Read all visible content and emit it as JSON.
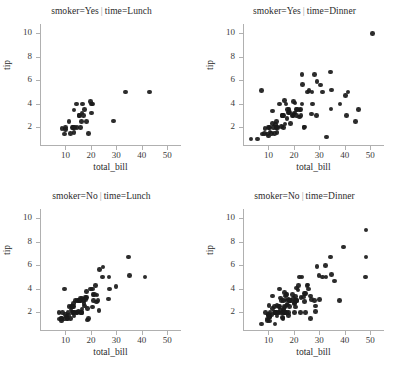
{
  "chart_data": {
    "type": "scatter",
    "title": "",
    "xlabel": "total_bill",
    "ylabel": "tip",
    "xlim": [
      0,
      55
    ],
    "ylim": [
      0.5,
      10.8
    ],
    "xticks": [
      10,
      20,
      30,
      40,
      50
    ],
    "yticks": [
      2,
      4,
      6,
      8,
      10
    ],
    "grid": false,
    "legend": "none",
    "marker_color": "#1a1a1a",
    "facet_separator": "|",
    "facets": [
      {
        "id": "smoker-yes-lunch",
        "title_left": "smoker=Yes",
        "title_right": "time=Lunch",
        "row": 0,
        "col": 0,
        "points": [
          [
            8.58,
            1.92
          ],
          [
            9.55,
            1.45
          ],
          [
            10.07,
            1.83
          ],
          [
            10.09,
            2.0
          ],
          [
            11.35,
            2.5
          ],
          [
            12.03,
            1.5
          ],
          [
            12.74,
            2.01
          ],
          [
            13.0,
            2.0
          ],
          [
            13.13,
            2.0
          ],
          [
            13.42,
            1.58
          ],
          [
            13.42,
            3.48
          ],
          [
            13.81,
            2.0
          ],
          [
            14.31,
            4.0
          ],
          [
            14.52,
            2.0
          ],
          [
            15.38,
            3.0
          ],
          [
            15.53,
            3.0
          ],
          [
            16.0,
            2.0
          ],
          [
            16.27,
            2.5
          ],
          [
            16.47,
            3.23
          ],
          [
            16.58,
            4.0
          ],
          [
            17.07,
            3.0
          ],
          [
            17.47,
            3.5
          ],
          [
            18.35,
            2.5
          ],
          [
            19.08,
            1.5
          ],
          [
            19.81,
            4.19
          ],
          [
            20.23,
            4.0
          ],
          [
            20.29,
            3.21
          ],
          [
            20.53,
            4.0
          ],
          [
            28.97,
            2.56
          ],
          [
            33.48,
            5.0
          ],
          [
            43.11,
            5.0
          ]
        ]
      },
      {
        "id": "smoker-yes-dinner",
        "title_left": "smoker=Yes",
        "title_right": "time=Dinner",
        "row": 0,
        "col": 1,
        "points": [
          [
            3.07,
            1.0
          ],
          [
            5.75,
            1.0
          ],
          [
            7.25,
            5.15
          ],
          [
            7.74,
            1.44
          ],
          [
            8.35,
            1.5
          ],
          [
            8.58,
            1.92
          ],
          [
            9.55,
            1.45
          ],
          [
            10.07,
            1.25
          ],
          [
            10.09,
            2.0
          ],
          [
            10.33,
            2.0
          ],
          [
            10.59,
            1.61
          ],
          [
            11.17,
            1.5
          ],
          [
            11.61,
            3.39
          ],
          [
            11.69,
            2.31
          ],
          [
            12.02,
            1.97
          ],
          [
            12.46,
            1.5
          ],
          [
            12.76,
            2.23
          ],
          [
            13.0,
            2.0
          ],
          [
            13.13,
            2.0
          ],
          [
            13.27,
            2.5
          ],
          [
            13.42,
            1.58
          ],
          [
            13.81,
            2.0
          ],
          [
            14.31,
            4.0
          ],
          [
            15.01,
            2.09
          ],
          [
            15.38,
            3.0
          ],
          [
            15.53,
            3.0
          ],
          [
            15.69,
            3.0
          ],
          [
            15.98,
            3.0
          ],
          [
            16.0,
            2.0
          ],
          [
            16.32,
            4.3
          ],
          [
            16.43,
            2.3
          ],
          [
            16.82,
            4.0
          ],
          [
            17.26,
            2.74
          ],
          [
            17.47,
            3.5
          ],
          [
            17.78,
            3.27
          ],
          [
            18.15,
            3.5
          ],
          [
            18.26,
            3.25
          ],
          [
            18.69,
            2.31
          ],
          [
            19.44,
            3.0
          ],
          [
            19.65,
            3.0
          ],
          [
            19.81,
            4.19
          ],
          [
            20.08,
            3.15
          ],
          [
            20.29,
            3.21
          ],
          [
            20.49,
            4.06
          ],
          [
            20.9,
            3.5
          ],
          [
            21.01,
            3.0
          ],
          [
            21.5,
            3.5
          ],
          [
            22.12,
            2.88
          ],
          [
            22.42,
            3.48
          ],
          [
            22.49,
            3.5
          ],
          [
            22.76,
            3.0
          ],
          [
            23.1,
            4.0
          ],
          [
            23.17,
            6.5
          ],
          [
            23.33,
            5.65
          ],
          [
            24.01,
            2.0
          ],
          [
            24.27,
            2.03
          ],
          [
            25.28,
            5.0
          ],
          [
            25.89,
            5.16
          ],
          [
            26.86,
            3.14
          ],
          [
            27.05,
            5.0
          ],
          [
            27.28,
            4.0
          ],
          [
            28.17,
            6.5
          ],
          [
            28.97,
            3.0
          ],
          [
            29.03,
            5.92
          ],
          [
            30.4,
            5.6
          ],
          [
            31.27,
            5.0
          ],
          [
            32.83,
            1.17
          ],
          [
            34.3,
            6.7
          ],
          [
            34.63,
            3.55
          ],
          [
            34.83,
            5.17
          ],
          [
            38.07,
            4.0
          ],
          [
            40.17,
            4.73
          ],
          [
            40.55,
            3.0
          ],
          [
            41.19,
            5.0
          ],
          [
            44.3,
            2.5
          ],
          [
            45.35,
            3.5
          ],
          [
            50.81,
            10.0
          ]
        ]
      },
      {
        "id": "smoker-no-lunch",
        "title_left": "smoker=No",
        "title_right": "time=Lunch",
        "row": 1,
        "col": 0,
        "points": [
          [
            7.51,
            2.0
          ],
          [
            7.56,
            1.44
          ],
          [
            8.35,
            1.5
          ],
          [
            8.51,
            1.25
          ],
          [
            8.52,
            1.48
          ],
          [
            8.77,
            2.0
          ],
          [
            9.55,
            1.45
          ],
          [
            9.6,
            4.0
          ],
          [
            10.07,
            1.83
          ],
          [
            10.33,
            1.67
          ],
          [
            10.65,
            1.5
          ],
          [
            10.77,
            1.47
          ],
          [
            11.02,
            1.98
          ],
          [
            11.24,
            1.76
          ],
          [
            11.35,
            2.5
          ],
          [
            12.03,
            1.5
          ],
          [
            12.16,
            2.2
          ],
          [
            12.48,
            2.52
          ],
          [
            12.54,
            2.5
          ],
          [
            12.66,
            2.5
          ],
          [
            12.69,
            2.0
          ],
          [
            13.0,
            2.0
          ],
          [
            13.16,
            2.75
          ],
          [
            13.27,
            2.5
          ],
          [
            13.37,
            2.0
          ],
          [
            13.42,
            1.68
          ],
          [
            13.81,
            2.0
          ],
          [
            14.0,
            3.0
          ],
          [
            14.48,
            2.0
          ],
          [
            14.52,
            2.0
          ],
          [
            14.83,
            3.02
          ],
          [
            15.01,
            2.09
          ],
          [
            15.38,
            3.0
          ],
          [
            15.53,
            3.0
          ],
          [
            15.81,
            3.16
          ],
          [
            15.98,
            3.0
          ],
          [
            16.0,
            2.0
          ],
          [
            16.21,
            2.0
          ],
          [
            16.43,
            2.3
          ],
          [
            16.47,
            3.23
          ],
          [
            16.49,
            2.0
          ],
          [
            17.07,
            3.0
          ],
          [
            17.26,
            2.74
          ],
          [
            17.46,
            2.54
          ],
          [
            17.78,
            3.27
          ],
          [
            17.92,
            3.08
          ],
          [
            18.24,
            3.76
          ],
          [
            18.26,
            3.25
          ],
          [
            18.64,
            1.36
          ],
          [
            18.69,
            2.31
          ],
          [
            19.08,
            1.5
          ],
          [
            19.81,
            4.0
          ],
          [
            20.53,
            4.0
          ],
          [
            20.69,
            2.45
          ],
          [
            20.9,
            3.5
          ],
          [
            21.01,
            3.0
          ],
          [
            21.5,
            3.5
          ],
          [
            21.7,
            4.3
          ],
          [
            22.12,
            2.88
          ],
          [
            22.42,
            3.48
          ],
          [
            22.76,
            3.0
          ],
          [
            23.1,
            2.15
          ],
          [
            23.33,
            5.65
          ],
          [
            24.52,
            5.0
          ],
          [
            24.71,
            5.85
          ],
          [
            26.86,
            3.14
          ],
          [
            27.05,
            5.0
          ],
          [
            27.2,
            4.0
          ],
          [
            29.8,
            4.2
          ],
          [
            34.83,
            6.7
          ],
          [
            35.26,
            5.15
          ],
          [
            41.19,
            5.0
          ]
        ]
      },
      {
        "id": "smoker-no-dinner",
        "title_left": "smoker=No",
        "title_right": "time=Dinner",
        "row": 1,
        "col": 1,
        "points": [
          [
            7.25,
            1.0
          ],
          [
            8.77,
            2.0
          ],
          [
            9.55,
            1.45
          ],
          [
            9.68,
            1.32
          ],
          [
            9.78,
            1.73
          ],
          [
            10.07,
            1.83
          ],
          [
            10.29,
            2.6
          ],
          [
            10.33,
            1.67
          ],
          [
            10.34,
            1.66
          ],
          [
            10.51,
            1.25
          ],
          [
            10.59,
            1.61
          ],
          [
            10.63,
            2.0
          ],
          [
            11.24,
            1.76
          ],
          [
            11.61,
            3.39
          ],
          [
            11.69,
            2.31
          ],
          [
            12.26,
            2.0
          ],
          [
            12.48,
            2.52
          ],
          [
            12.6,
            1.0
          ],
          [
            12.69,
            2.0
          ],
          [
            12.74,
            2.01
          ],
          [
            13.03,
            2.0
          ],
          [
            13.39,
            2.61
          ],
          [
            13.42,
            1.68
          ],
          [
            13.81,
            2.0
          ],
          [
            14.07,
            2.5
          ],
          [
            14.15,
            2.0
          ],
          [
            14.26,
            2.5
          ],
          [
            14.31,
            4.0
          ],
          [
            14.73,
            2.2
          ],
          [
            14.78,
            3.23
          ],
          [
            15.04,
            1.96
          ],
          [
            15.06,
            3.0
          ],
          [
            15.42,
            1.57
          ],
          [
            15.69,
            1.5
          ],
          [
            15.77,
            2.23
          ],
          [
            15.95,
            2.0
          ],
          [
            15.98,
            3.0
          ],
          [
            16.04,
            2.24
          ],
          [
            16.21,
            2.0
          ],
          [
            16.29,
            3.71
          ],
          [
            16.31,
            2.0
          ],
          [
            16.4,
            2.5
          ],
          [
            16.45,
            2.47
          ],
          [
            16.49,
            2.0
          ],
          [
            16.66,
            3.4
          ],
          [
            16.93,
            3.07
          ],
          [
            16.97,
            3.5
          ],
          [
            16.99,
            1.97
          ],
          [
            17.29,
            2.71
          ],
          [
            17.31,
            3.5
          ],
          [
            17.59,
            2.64
          ],
          [
            17.82,
            1.75
          ],
          [
            17.89,
            2.0
          ],
          [
            17.92,
            3.08
          ],
          [
            18.04,
            3.0
          ],
          [
            18.29,
            3.0
          ],
          [
            18.35,
            2.5
          ],
          [
            18.43,
            3.0
          ],
          [
            18.78,
            3.0
          ],
          [
            19.49,
            3.51
          ],
          [
            19.82,
            3.18
          ],
          [
            20.23,
            2.01
          ],
          [
            20.27,
            2.83
          ],
          [
            20.29,
            2.75
          ],
          [
            20.45,
            3.0
          ],
          [
            20.65,
            3.35
          ],
          [
            20.69,
            2.45
          ],
          [
            20.92,
            4.08
          ],
          [
            21.01,
            3.0
          ],
          [
            21.16,
            3.0
          ],
          [
            21.58,
            3.92
          ],
          [
            21.7,
            4.3
          ],
          [
            22.23,
            5.0
          ],
          [
            22.67,
            2.0
          ],
          [
            22.75,
            3.25
          ],
          [
            23.17,
            5.0
          ],
          [
            23.68,
            3.31
          ],
          [
            24.06,
            3.6
          ],
          [
            24.08,
            2.92
          ],
          [
            24.55,
            2.0
          ],
          [
            24.59,
            3.61
          ],
          [
            25.21,
            4.29
          ],
          [
            25.56,
            4.34
          ],
          [
            25.71,
            4.0
          ],
          [
            26.41,
            1.5
          ],
          [
            26.59,
            3.41
          ],
          [
            26.88,
            3.12
          ],
          [
            28.15,
            3.0
          ],
          [
            28.44,
            2.56
          ],
          [
            28.55,
            2.05
          ],
          [
            29.03,
            5.92
          ],
          [
            29.85,
            5.14
          ],
          [
            30.14,
            3.09
          ],
          [
            31.27,
            5.0
          ],
          [
            32.4,
            6.0
          ],
          [
            32.68,
            5.0
          ],
          [
            34.3,
            6.7
          ],
          [
            34.81,
            5.2
          ],
          [
            35.83,
            4.67
          ],
          [
            38.01,
            3.0
          ],
          [
            39.42,
            7.58
          ],
          [
            48.17,
            5.0
          ],
          [
            48.27,
            6.73
          ],
          [
            48.33,
            9.0
          ]
        ]
      }
    ]
  }
}
